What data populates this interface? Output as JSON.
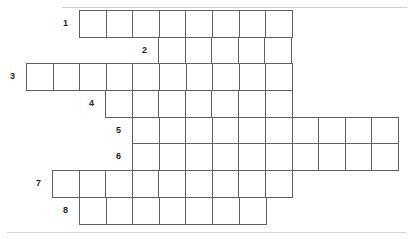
{
  "puzzle": {
    "type": "crossword-grid",
    "title": "",
    "cell_width": 26.6,
    "cell_height": 26.7,
    "origin_x": 26,
    "origin_y": 10,
    "grid_columns": 14,
    "grid_rows": 8,
    "colors": {
      "cell_border": "#5d6166",
      "cell_fill": "#ffffff",
      "number_text": "#1d1f22",
      "rule": "#c9ccd0",
      "page_background": "#ffffff"
    },
    "rows": [
      {
        "number": "1",
        "row_index": 0,
        "start_col": 2,
        "cells": 8,
        "x": 79,
        "y": 10,
        "label_x": 62,
        "label_y": 19
      },
      {
        "number": "2",
        "row_index": 1,
        "start_col": 5,
        "cells": 5,
        "x": 158,
        "y": 37,
        "label_x": 141,
        "label_y": 46
      },
      {
        "number": "3",
        "row_index": 2,
        "start_col": 0,
        "cells": 10,
        "x": 26,
        "y": 63,
        "label_x": 9,
        "label_y": 72
      },
      {
        "number": "4",
        "row_index": 3,
        "start_col": 3,
        "cells": 7,
        "x": 105,
        "y": 90,
        "label_x": 88,
        "label_y": 99
      },
      {
        "number": "5",
        "row_index": 4,
        "start_col": 4,
        "cells": 10,
        "x": 132,
        "y": 117,
        "label_x": 115,
        "label_y": 126
      },
      {
        "number": "6",
        "row_index": 5,
        "start_col": 4,
        "cells": 10,
        "x": 132,
        "y": 143,
        "label_x": 115,
        "label_y": 152
      },
      {
        "number": "7",
        "row_index": 6,
        "start_col": 1,
        "cells": 9,
        "x": 52,
        "y": 170,
        "label_x": 35,
        "label_y": 179
      },
      {
        "number": "8",
        "row_index": 7,
        "start_col": 2,
        "cells": 7,
        "x": 79,
        "y": 197,
        "label_x": 62,
        "label_y": 206
      }
    ]
  }
}
